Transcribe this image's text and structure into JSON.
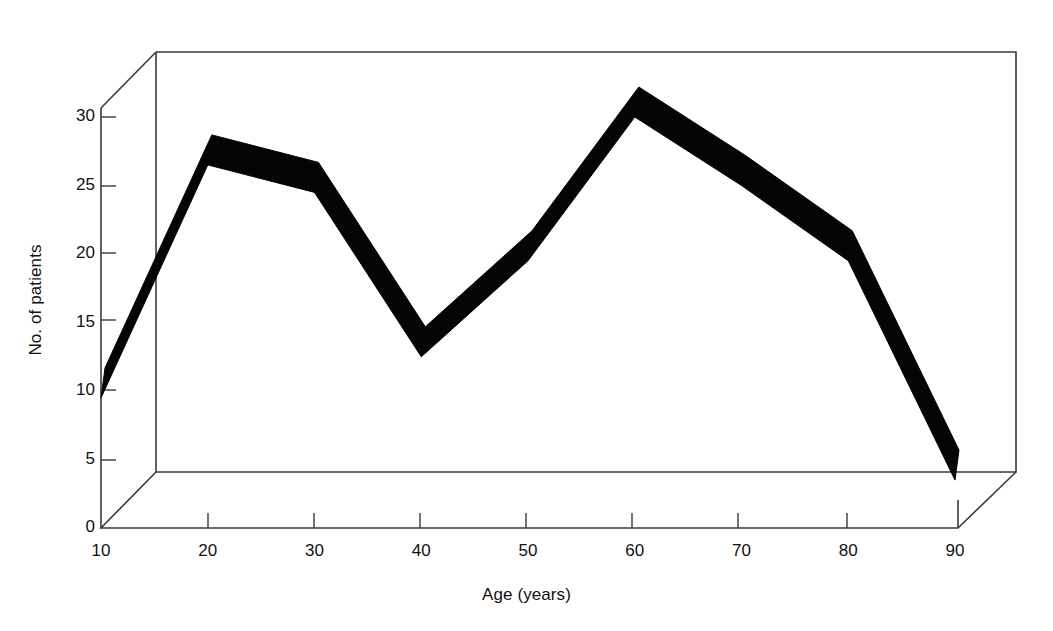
{
  "chart_data": {
    "type": "line",
    "title": "",
    "subtitle": "",
    "xlabel": "Age (years)",
    "ylabel": "No. of patients",
    "style": "3d-ribbon",
    "grid": false,
    "legend": null,
    "legend_position": "none",
    "xlim": [
      10,
      90
    ],
    "ylim": [
      0,
      30
    ],
    "xticks": [
      10,
      20,
      30,
      40,
      50,
      60,
      70,
      80,
      90
    ],
    "yticks": [
      0,
      5,
      10,
      15,
      20,
      25,
      30
    ],
    "xtick_labels": [
      "10",
      "20",
      "30",
      "40",
      "50",
      "60",
      "70",
      "80",
      "90"
    ],
    "ytick_labels": [
      "0",
      "5",
      "10",
      "15",
      "20",
      "25",
      "30"
    ],
    "x": [
      10,
      20,
      30,
      40,
      50,
      60,
      70,
      80,
      90
    ],
    "values": [
      9.5,
      26.5,
      24.5,
      12.5,
      19.5,
      30,
      25,
      19.5,
      3.5
    ],
    "series": [
      {
        "name": "No. of patients",
        "color": "#000000",
        "x": [
          10,
          20,
          30,
          40,
          50,
          60,
          70,
          80,
          90
        ],
        "values": [
          9.5,
          26.5,
          24.5,
          12.5,
          19.5,
          30,
          25,
          19.5,
          3.5
        ]
      }
    ],
    "annotations": []
  },
  "axes": {
    "x_title": "Age (years)",
    "y_title": "No. of patients"
  },
  "colors": {
    "ribbon": "#000000",
    "frame": "#3a3a3a",
    "background": "#ffffff"
  }
}
